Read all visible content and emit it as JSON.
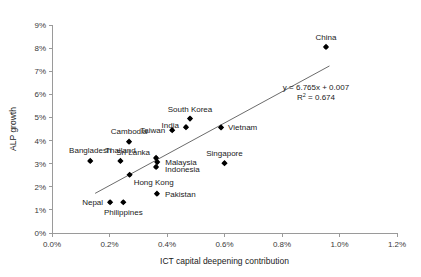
{
  "chart_data": {
    "type": "scatter",
    "title": "",
    "xlabel": "ICT capital deepening contribution",
    "ylabel": "ALP growth",
    "xlim": [
      0.0,
      1.2
    ],
    "ylim": [
      0.0,
      9.0
    ],
    "xtick_labels": [
      "0.0%",
      "0.2%",
      "0.4%",
      "0.6%",
      "0.8%",
      "1.0%",
      "1.2%"
    ],
    "xtick_values": [
      0.0,
      0.2,
      0.4,
      0.6,
      0.8,
      1.0,
      1.2
    ],
    "ytick_labels": [
      "0%",
      "1%",
      "2%",
      "3%",
      "4%",
      "5%",
      "6%",
      "7%",
      "8%",
      "9%"
    ],
    "ytick_values": [
      0,
      1,
      2,
      3,
      4,
      5,
      6,
      7,
      8,
      9
    ],
    "grid": false,
    "legend": "none",
    "marker_color": "#000000",
    "trendline_color": "#5a5a5a",
    "points": [
      {
        "name": "China",
        "x": 0.953,
        "y": 8.05,
        "label_dx": 0,
        "label_dy": -7,
        "anchor": "middle"
      },
      {
        "name": "South Korea",
        "x": 0.48,
        "y": 4.95,
        "label_dx": 0,
        "label_dy": -7,
        "anchor": "middle"
      },
      {
        "name": "Vietnam",
        "x": 0.588,
        "y": 4.57,
        "label_dx": 7,
        "label_dy": 3,
        "anchor": "start"
      },
      {
        "name": "India",
        "x": 0.466,
        "y": 4.58,
        "label_dx": -7,
        "label_dy": 1,
        "anchor": "end"
      },
      {
        "name": "Taiwan",
        "x": 0.418,
        "y": 4.45,
        "label_dx": -7,
        "label_dy": 3,
        "anchor": "end"
      },
      {
        "name": "Cambodia",
        "x": 0.268,
        "y": 3.95,
        "label_dx": 0,
        "label_dy": -8,
        "anchor": "middle"
      },
      {
        "name": "Sri Lanka",
        "x": 0.362,
        "y": 3.25,
        "label_dx": -6,
        "label_dy": -3,
        "anchor": "end"
      },
      {
        "name": "Malaysia",
        "x": 0.366,
        "y": 3.07,
        "label_dx": 8,
        "label_dy": 3,
        "anchor": "start"
      },
      {
        "name": "Indonesia",
        "x": 0.362,
        "y": 2.86,
        "label_dx": 9,
        "label_dy": 5,
        "anchor": "start"
      },
      {
        "name": "Singapore",
        "x": 0.6,
        "y": 3.02,
        "label_dx": 0,
        "label_dy": -7,
        "anchor": "middle"
      },
      {
        "name": "Bangladesh",
        "x": 0.133,
        "y": 3.12,
        "label_dx": 0,
        "label_dy": -8,
        "anchor": "middle"
      },
      {
        "name": "Thailand",
        "x": 0.238,
        "y": 3.12,
        "label_dx": 0,
        "label_dy": -8,
        "anchor": "middle"
      },
      {
        "name": "Hong Kong",
        "x": 0.27,
        "y": 2.52,
        "label_dx": 4,
        "label_dy": 10,
        "anchor": "start"
      },
      {
        "name": "Pakistan",
        "x": 0.365,
        "y": 1.7,
        "label_dx": 8,
        "label_dy": 3,
        "anchor": "start"
      },
      {
        "name": "Nepal",
        "x": 0.202,
        "y": 1.33,
        "label_dx": -7,
        "label_dy": 3,
        "anchor": "end"
      },
      {
        "name": "Philippines",
        "x": 0.248,
        "y": 1.33,
        "label_dx": 0,
        "label_dy": 13,
        "anchor": "middle"
      }
    ],
    "trendline": {
      "equation": "y = 6.765x + 0.007",
      "slope": 6.765,
      "intercept": 0.007,
      "r_squared_label": "R",
      "r_squared_sup": "2",
      "r_squared_value": " = 0.674",
      "x_start": 0.15,
      "x_end": 0.965
    }
  }
}
